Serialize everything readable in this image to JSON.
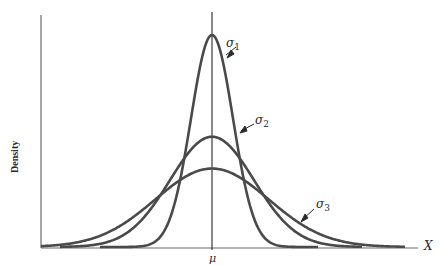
{
  "chart_data": {
    "type": "line",
    "title": "",
    "xlabel": "X",
    "ylabel": "Density",
    "x_tick_labels": [
      "μ"
    ],
    "grid": false,
    "legend": "none (curves labeled directly by arrows)",
    "series": [
      {
        "name": "σ1",
        "label": "σ",
        "subscript": "1",
        "mean": 0,
        "sd": 0.5,
        "relative_peak": 1.0
      },
      {
        "name": "σ2",
        "label": "σ",
        "subscript": "2",
        "mean": 0,
        "sd": 1.0,
        "relative_peak": 0.52
      },
      {
        "name": "σ3",
        "label": "σ",
        "subscript": "3",
        "mean": 0,
        "sd": 1.35,
        "relative_peak": 0.37
      }
    ],
    "annotations": [
      {
        "text": "σ1",
        "points_to": "right flank of σ1 curve"
      },
      {
        "text": "σ2",
        "points_to": "right shoulder of σ2 curve"
      },
      {
        "text": "σ3",
        "points_to": "right tail of σ3 curve"
      }
    ]
  },
  "labels": {
    "ylabel": "Density",
    "xlabel": "X",
    "mu": "μ",
    "sigma": "σ",
    "s1": "1",
    "s2": "2",
    "s3": "3"
  },
  "colors": {
    "curve": "#4a4a4a",
    "axis": "#5a5a5a",
    "text": "#2a2a2a"
  }
}
